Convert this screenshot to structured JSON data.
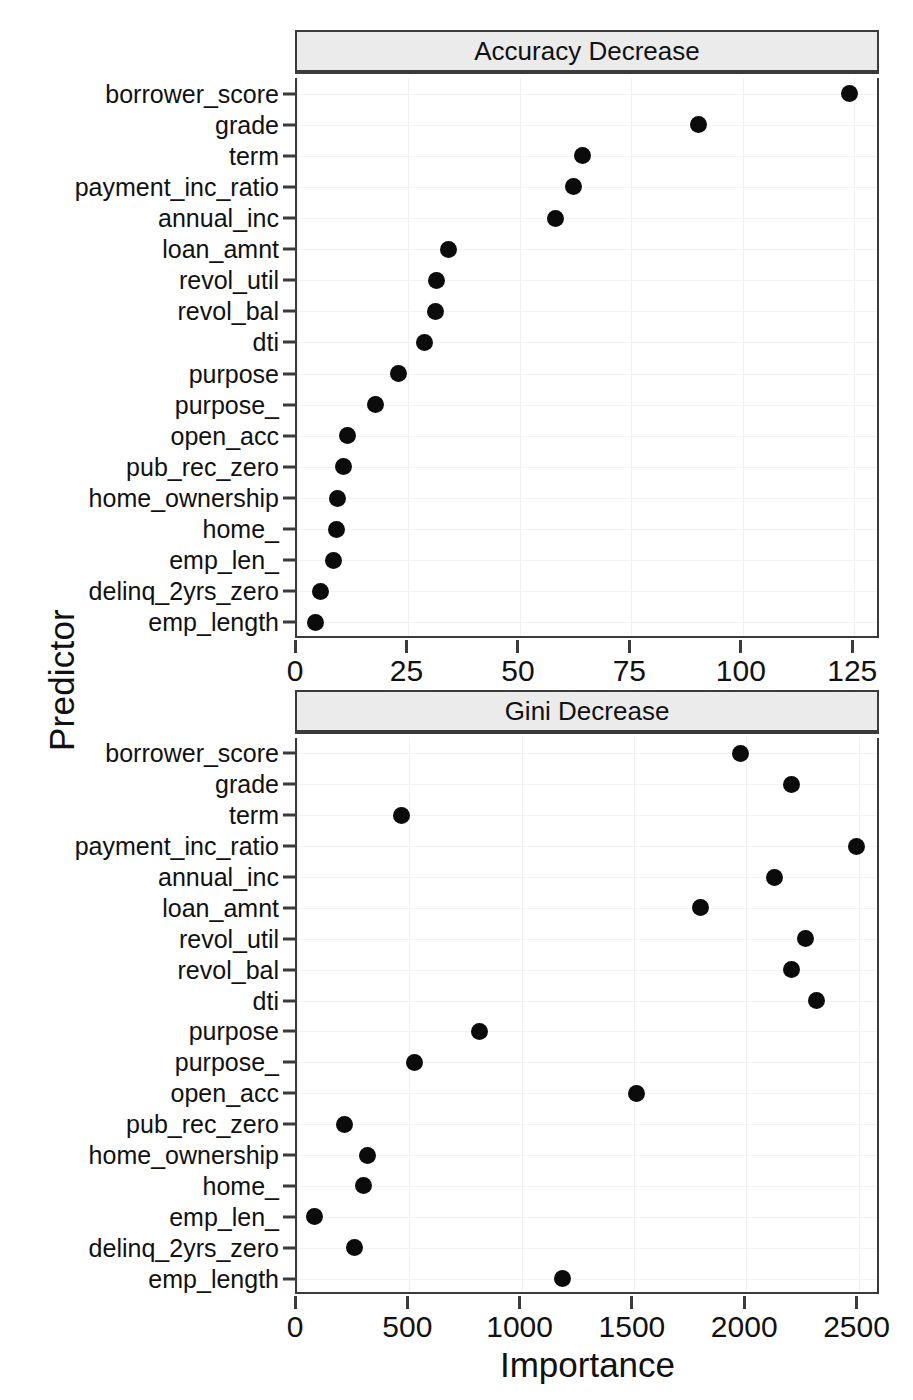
{
  "chart_data": {
    "type": "scatter",
    "title": "",
    "xlabel": "Importance",
    "ylabel": "Predictor",
    "grid": true,
    "legend": "none",
    "orientation": "dot-plot",
    "categories": [
      "borrower_score",
      "grade",
      "term",
      "payment_inc_ratio",
      "annual_inc",
      "loan_amnt",
      "revol_util",
      "revol_bal",
      "dti",
      "purpose",
      "purpose_",
      "open_acc",
      "pub_rec_zero",
      "home_ownership",
      "home_",
      "emp_len_",
      "delinq_2yrs_zero",
      "emp_length"
    ],
    "panels": [
      {
        "strip_label": "Accuracy Decrease",
        "xlim": [
          0,
          131
        ],
        "xticks": [
          0,
          25,
          50,
          75,
          100,
          125
        ],
        "xticklabels": [
          "0",
          "25",
          "50",
          "75",
          "100",
          "125"
        ],
        "values": [
          124,
          90,
          64,
          62,
          58,
          34,
          31.2,
          31.0,
          28.7,
          22.7,
          17.5,
          11.3,
          10.5,
          9.1,
          8.9,
          8.1,
          5.2,
          4.2
        ]
      },
      {
        "strip_label": "Gini Decrease",
        "xlim": [
          0,
          2600
        ],
        "xticks": [
          0,
          500,
          1000,
          1500,
          2000,
          2500
        ],
        "xticklabels": [
          "0",
          "500",
          "1000",
          "1500",
          "2000",
          "2500"
        ],
        "values": [
          1975,
          2200,
          467,
          2490,
          2128,
          1795,
          2262,
          2200,
          2312,
          813,
          525,
          1513,
          210,
          313,
          296,
          80,
          255,
          1180
        ]
      }
    ]
  },
  "colors": {
    "point": "#0b0b0b",
    "strip_background": "#ebebeb",
    "frame": "#3b3b3b",
    "grid": "#f0f0f0",
    "text": "#111111",
    "background": "#ffffff"
  }
}
